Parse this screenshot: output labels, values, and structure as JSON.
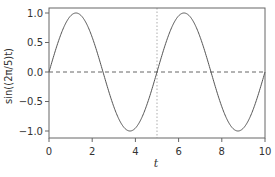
{
  "chart_data": {
    "type": "line",
    "title": "",
    "xlabel": "t",
    "ylabel": "sin((2π/5)t)",
    "xlim": [
      0,
      10
    ],
    "ylim": [
      -1.12,
      1.08
    ],
    "grid": false,
    "legend": null,
    "x_ticks": [
      0,
      2,
      4,
      6,
      8,
      10
    ],
    "x_tick_labels": [
      "0",
      "2",
      "4",
      "6",
      "8",
      "10"
    ],
    "y_ticks": [
      1.0,
      0.5,
      0.0,
      -0.5,
      -1.0
    ],
    "y_tick_labels": [
      "1.0",
      "0.5",
      "0.0",
      "−0.5",
      "−1.0"
    ],
    "series": [
      {
        "name": "sin((2π/5)t)",
        "style": "solid",
        "color": "#555555",
        "function": "sin(2*pi/5*t)",
        "x": [
          0,
          0.5,
          1,
          1.25,
          1.5,
          2,
          2.5,
          3,
          3.5,
          3.75,
          4,
          4.5,
          5,
          5.5,
          6,
          6.25,
          6.5,
          7,
          7.5,
          8,
          8.5,
          8.75,
          9,
          9.5,
          10
        ],
        "values": [
          0,
          0.588,
          0.951,
          1.0,
          0.951,
          0.588,
          0,
          -0.588,
          -0.951,
          -1.0,
          -0.951,
          -0.588,
          0,
          0.588,
          0.951,
          1.0,
          0.951,
          0.588,
          0,
          -0.588,
          -0.951,
          -1.0,
          -0.951,
          -0.588,
          0
        ]
      },
      {
        "name": "zero line",
        "style": "dashed",
        "color": "#555555",
        "x": [
          0,
          10
        ],
        "values": [
          0,
          0
        ]
      }
    ],
    "annotations": [
      {
        "type": "vline",
        "x": 5,
        "style": "dotted",
        "color": "#bbbbbb"
      }
    ]
  }
}
